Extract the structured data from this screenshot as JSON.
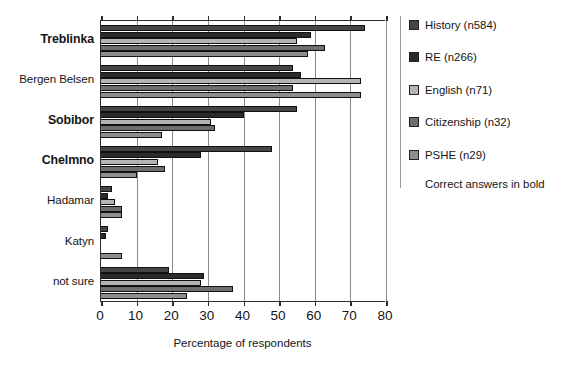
{
  "chart_data": {
    "type": "bar",
    "orientation": "horizontal",
    "title": "",
    "subtitle": "",
    "xlabel": "Percentage of respondents",
    "ylabel": "",
    "xlim": [
      0,
      80
    ],
    "xticks": [
      0,
      10,
      20,
      30,
      40,
      50,
      60,
      70,
      80
    ],
    "xtick_labels": [
      "0",
      "10",
      "20",
      "30",
      "40",
      "50",
      "60",
      "70",
      "80"
    ],
    "grid": "vertical",
    "legend_position": "right",
    "annotations": [
      "Correct answers in bold"
    ],
    "categories": [
      "Treblinka",
      "Bergen Belsen",
      "Sobibor",
      "Chelmno",
      "Hadamar",
      "Katyn",
      "not sure"
    ],
    "categories_bold": [
      true,
      false,
      true,
      true,
      false,
      false,
      false
    ],
    "series": [
      {
        "name": "History (n584)",
        "color": "#454545",
        "values": [
          74,
          54,
          55,
          48,
          3,
          2,
          19
        ]
      },
      {
        "name": "RE (n266)",
        "color": "#2b2b2b",
        "values": [
          59,
          56,
          40,
          28,
          2,
          1.5,
          29
        ]
      },
      {
        "name": "English (n71)",
        "color": "#b4b4b4",
        "values": [
          55,
          73,
          31,
          16,
          4,
          0,
          28
        ]
      },
      {
        "name": "Citizenship (n32)",
        "color": "#6e6e6e",
        "values": [
          63,
          54,
          32,
          18,
          6,
          0,
          37
        ]
      },
      {
        "name": "PSHE (n29)",
        "color": "#8e8e8e",
        "values": [
          58,
          73,
          17,
          10,
          6,
          6,
          24
        ]
      }
    ]
  },
  "axis": {
    "x_title": "Percentage of respondents"
  },
  "legend": {
    "note": "Correct answers in bold"
  }
}
